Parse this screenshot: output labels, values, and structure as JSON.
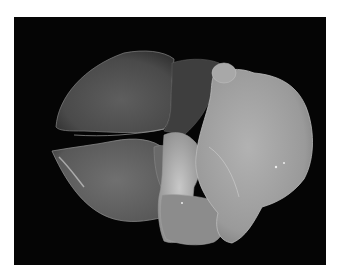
{
  "image": {
    "subject": "grayscale photograph of an excised organ specimen on a black background",
    "background_color": "#050505",
    "border_color": "#ffffff",
    "frame": {
      "x": 14,
      "y": 17,
      "width": 312,
      "height": 248
    }
  },
  "regions": [
    {
      "name": "upper-left-lobe",
      "tone": "#5a5a5a"
    },
    {
      "name": "lower-left-lobe",
      "tone": "#6a6a6a"
    },
    {
      "name": "central-pale-mass",
      "tone": "#b0b0b0"
    },
    {
      "name": "right-large-mass",
      "tone": "#a2a2a2"
    }
  ]
}
